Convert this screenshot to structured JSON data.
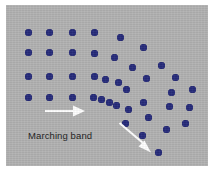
{
  "figure": {
    "caption_label": "Marching band",
    "field_color": "#b2b2b2",
    "marcher_color": "#252a7a",
    "arrow_color": "#ffffff",
    "background_color": "#ffffff",
    "width": 216,
    "height": 172
  },
  "chart_data": {
    "type": "scatter",
    "title": "Marching band",
    "xlabel": "",
    "ylabel": "",
    "xlim": [
      0,
      202
    ],
    "ylim": [
      0,
      161
    ],
    "grid": false,
    "legend": null,
    "annotations": [
      {
        "name": "marching-band-label",
        "text": "Marching band",
        "x": 22,
        "y": 126
      },
      {
        "name": "direction-arrow-straight",
        "type": "arrow",
        "text": "",
        "x1": 38,
        "y1": 106,
        "x2": 73,
        "y2": 106,
        "color": "#ffffff"
      },
      {
        "name": "direction-arrow-deflected",
        "type": "arrow",
        "text": "",
        "x1": 112,
        "y1": 118,
        "x2": 141,
        "y2": 142,
        "color": "#ffffff"
      }
    ],
    "series": [
      {
        "name": "band-members",
        "marker": "circle",
        "marker_size": 7,
        "color": "#252a7a",
        "points": [
          [
            22,
            27
          ],
          [
            43,
            27
          ],
          [
            66,
            27
          ],
          [
            88,
            27
          ],
          [
            114,
            32
          ],
          [
            22,
            47
          ],
          [
            43,
            47
          ],
          [
            66,
            47
          ],
          [
            88,
            48
          ],
          [
            108,
            52
          ],
          [
            137,
            42
          ],
          [
            22,
            71
          ],
          [
            43,
            71
          ],
          [
            66,
            71
          ],
          [
            88,
            71
          ],
          [
            99,
            74
          ],
          [
            112,
            77
          ],
          [
            126,
            62
          ],
          [
            155,
            60
          ],
          [
            22,
            92
          ],
          [
            43,
            92
          ],
          [
            66,
            92
          ],
          [
            87,
            92
          ],
          [
            95,
            94
          ],
          [
            103,
            97
          ],
          [
            110,
            100
          ],
          [
            120,
            84
          ],
          [
            140,
            73
          ],
          [
            169,
            72
          ],
          [
            122,
            104
          ],
          [
            137,
            97
          ],
          [
            165,
            87
          ],
          [
            186,
            84
          ],
          [
            119,
            118
          ],
          [
            142,
            112
          ],
          [
            163,
            101
          ],
          [
            183,
            102
          ],
          [
            136,
            130
          ],
          [
            160,
            124
          ],
          [
            179,
            118
          ],
          [
            152,
            147
          ]
        ]
      }
    ]
  }
}
